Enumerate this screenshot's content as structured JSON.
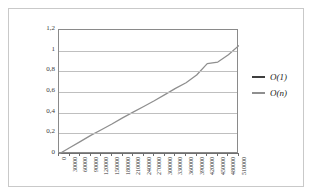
{
  "chart_data": {
    "type": "line",
    "title": "",
    "xlabel": "",
    "ylabel": "",
    "grid": true,
    "legend_position": "right",
    "ylim": [
      0,
      1.2
    ],
    "y_ticks": [
      "0",
      "0,2",
      "0,4",
      "0,6",
      "0,8",
      "1",
      "1,2"
    ],
    "y_tick_values": [
      0,
      0.2,
      0.4,
      0.6,
      0.8,
      1,
      1.2
    ],
    "categories": [
      "0",
      "30000",
      "60000",
      "90000",
      "120000",
      "150000",
      "180000",
      "210000",
      "240000",
      "270000",
      "300000",
      "330000",
      "360000",
      "390000",
      "420000",
      "450000",
      "480000",
      "510000"
    ],
    "x_values": [
      0,
      30000,
      60000,
      90000,
      120000,
      150000,
      180000,
      210000,
      240000,
      270000,
      300000,
      330000,
      360000,
      390000,
      420000,
      450000,
      480000,
      510000
    ],
    "series": [
      {
        "name": "O(1)",
        "color": "#3f3f3f",
        "values": [
          0,
          0,
          0,
          0,
          0,
          0,
          0,
          0,
          0,
          0,
          0,
          0,
          0,
          0,
          0,
          0,
          0,
          0
        ]
      },
      {
        "name": "O(n)",
        "color": "#8f8f8f",
        "values": [
          0,
          0.06,
          0.12,
          0.18,
          0.235,
          0.29,
          0.35,
          0.405,
          0.46,
          0.515,
          0.575,
          0.635,
          0.69,
          0.765,
          0.875,
          0.89,
          0.96,
          1.05
        ]
      }
    ]
  },
  "legend": {
    "items": [
      {
        "label": "O(1)",
        "color": "#3f3f3f"
      },
      {
        "label": "O(n)",
        "color": "#8f8f8f"
      }
    ]
  },
  "colors": {
    "frame_border": "#c9c9c9",
    "plot_border": "#8a8a8a",
    "gridline": "#bfbfbf",
    "background": "#ffffff"
  }
}
